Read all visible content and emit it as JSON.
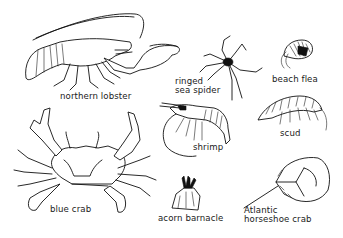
{
  "figure": {
    "background": "#ffffff",
    "ink_color": "#111111",
    "specimens": [
      {
        "id": "northern-lobster",
        "label": "northern lobster"
      },
      {
        "id": "ringed-sea-spider",
        "label": "ringed\nsea spider"
      },
      {
        "id": "beach-flea",
        "label": "beach flea"
      },
      {
        "id": "scud",
        "label": "scud"
      },
      {
        "id": "shrimp",
        "label": "shrimp"
      },
      {
        "id": "blue-crab",
        "label": "blue crab"
      },
      {
        "id": "acorn-barnacle",
        "label": "acorn barnacle"
      },
      {
        "id": "atlantic-horseshoe-crab",
        "label": "Atlantic\nhorseshoe crab"
      }
    ]
  }
}
